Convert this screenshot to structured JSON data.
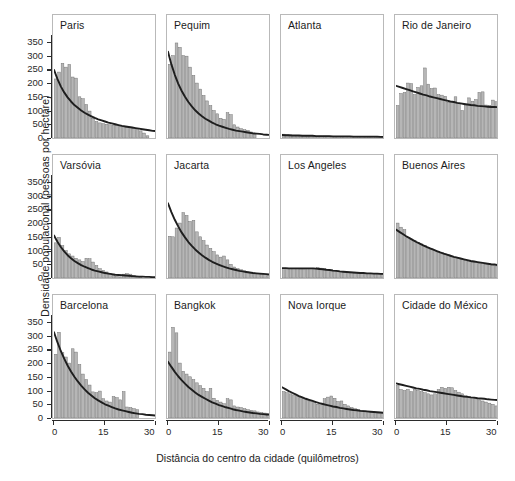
{
  "chart_data": {
    "type": "bar",
    "title": "",
    "xlabel": "Distância do centro da cidade (quilômetros)",
    "ylabel": "Densidade populacional (pessoas por hectare)",
    "xlim": [
      0,
      30
    ],
    "ylim": [
      0,
      375
    ],
    "yticks": [
      0,
      50,
      100,
      150,
      200,
      250,
      300,
      350
    ],
    "xticks": [
      0,
      15,
      30
    ],
    "grid": false,
    "legend": false,
    "layout": {
      "rows": 3,
      "cols": 4
    },
    "bin_width_km": 1,
    "series_note": "Each panel: histogram bars of population density by distance ring, with fitted exponential/linear decay curve overlay",
    "panels": [
      {
        "name": "Paris",
        "row": 0,
        "col": 0,
        "bars": [
          215,
          240,
          272,
          258,
          268,
          222,
          218,
          150,
          143,
          122,
          98,
          72,
          60,
          55,
          52,
          50,
          48,
          47,
          46,
          44,
          42,
          40,
          38,
          34,
          30,
          26,
          18,
          8
        ],
        "fit": [
          248,
          215,
          188,
          166,
          148,
          133,
          120,
          110,
          100,
          92,
          85,
          79,
          73,
          68,
          64,
          60,
          56,
          53,
          50,
          47,
          44,
          42,
          40,
          38,
          36,
          34,
          32,
          30,
          28,
          26,
          25
        ]
      },
      {
        "name": "Pequim",
        "row": 0,
        "col": 1,
        "bars": [
          268,
          300,
          346,
          330,
          300,
          298,
          258,
          228,
          200,
          178,
          155,
          135,
          118,
          100,
          88,
          72,
          68,
          92,
          85,
          48,
          40,
          34,
          30,
          28,
          22,
          14
        ],
        "fit": [
          314,
          268,
          230,
          198,
          172,
          150,
          131,
          115,
          101,
          89,
          79,
          70,
          63,
          56,
          50,
          45,
          41,
          37,
          33,
          30,
          27,
          25,
          23,
          21,
          19,
          17,
          16,
          15,
          13,
          12,
          11
        ]
      },
      {
        "name": "Atlanta",
        "row": 0,
        "col": 2,
        "bars": [
          14,
          12,
          11,
          10,
          10,
          9,
          9,
          8,
          8,
          8,
          7,
          7,
          7,
          7,
          6,
          6,
          6,
          6,
          6,
          5,
          5,
          5,
          5,
          5,
          4,
          4,
          4,
          4,
          4,
          4
        ],
        "fit": [
          11,
          10,
          10,
          9,
          9,
          9,
          8,
          8,
          8,
          8,
          7,
          7,
          7,
          7,
          7,
          6,
          6,
          6,
          6,
          6,
          6,
          5,
          5,
          5,
          5,
          5,
          5,
          5,
          5,
          4,
          4
        ]
      },
      {
        "name": "Rio de Janeiro",
        "row": 0,
        "col": 3,
        "bars": [
          118,
          162,
          166,
          200,
          198,
          158,
          184,
          190,
          255,
          196,
          180,
          182,
          158,
          156,
          152,
          130,
          132,
          150,
          126,
          100,
          118,
          146,
          134,
          140,
          166,
          168,
          120,
          118,
          138,
          132
        ],
        "fit": [
          190,
          186,
          182,
          178,
          174,
          170,
          166,
          162,
          158,
          155,
          151,
          148,
          145,
          142,
          139,
          136,
          133,
          131,
          128,
          126,
          124,
          122,
          120,
          119,
          117,
          116,
          115,
          114,
          113,
          113,
          112
        ]
      },
      {
        "name": "Varsóvia",
        "row": 1,
        "col": 0,
        "bars": [
          128,
          148,
          118,
          100,
          88,
          80,
          72,
          66,
          60,
          72,
          70,
          58,
          46,
          34,
          28,
          22,
          16,
          10,
          6,
          4,
          14,
          16,
          14,
          10,
          6,
          4
        ],
        "fit": [
          155,
          132,
          113,
          97,
          83,
          72,
          62,
          54,
          47,
          41,
          36,
          31,
          27,
          24,
          21,
          18,
          16,
          14,
          12,
          11,
          10,
          9,
          8,
          7,
          6,
          5,
          5,
          4,
          4,
          3,
          3
        ]
      },
      {
        "name": "Jacarta",
        "row": 1,
        "col": 1,
        "bars": [
          152,
          150,
          182,
          200,
          238,
          228,
          206,
          210,
          168,
          150,
          136,
          120,
          108,
          96,
          84,
          76,
          80,
          66,
          50,
          40,
          34,
          30,
          26,
          22,
          20,
          18,
          16,
          14,
          12,
          10
        ],
        "fit": [
          272,
          240,
          212,
          188,
          166,
          148,
          131,
          117,
          104,
          93,
          83,
          74,
          66,
          59,
          53,
          48,
          43,
          39,
          35,
          32,
          29,
          26,
          24,
          22,
          20,
          18,
          17,
          16,
          15,
          14,
          13
        ]
      },
      {
        "name": "Los Angeles",
        "row": 1,
        "col": 2,
        "bars": [
          34,
          36,
          35,
          34,
          34,
          33,
          33,
          34,
          35,
          36,
          38,
          36,
          34,
          32,
          30,
          28,
          26,
          24,
          22,
          20,
          19,
          18,
          18,
          17,
          17,
          16,
          16,
          15,
          15,
          14
        ],
        "fit": [
          36,
          36,
          35,
          35,
          35,
          35,
          35,
          35,
          35,
          35,
          34,
          33,
          32,
          30,
          29,
          27,
          26,
          24,
          23,
          22,
          21,
          20,
          19,
          18,
          18,
          17,
          17,
          16,
          16,
          15,
          15
        ]
      },
      {
        "name": "Buenos Aires",
        "row": 1,
        "col": 3,
        "bars": [
          200,
          185,
          176,
          148,
          142,
          136,
          130,
          124,
          118,
          112,
          106,
          100,
          96,
          92,
          88,
          84,
          80,
          76,
          72,
          68,
          64,
          60,
          58,
          56,
          54,
          52,
          50,
          48,
          46,
          44
        ],
        "fit": [
          176,
          168,
          160,
          152,
          145,
          138,
          131,
          125,
          119,
          113,
          108,
          103,
          98,
          93,
          89,
          85,
          81,
          77,
          74,
          71,
          68,
          65,
          62,
          60,
          58,
          56,
          54,
          52,
          50,
          49,
          47
        ]
      },
      {
        "name": "Barcelona",
        "row": 2,
        "col": 0,
        "bars": [
          232,
          312,
          238,
          222,
          200,
          252,
          240,
          195,
          160,
          140,
          120,
          95,
          92,
          98,
          70,
          62,
          58,
          78,
          74,
          66,
          96,
          40,
          38,
          34,
          30
        ],
        "fit": [
          312,
          276,
          244,
          216,
          191,
          169,
          150,
          133,
          118,
          104,
          92,
          82,
          72,
          64,
          57,
          50,
          45,
          40,
          35,
          31,
          28,
          25,
          22,
          19,
          17,
          15,
          14,
          12,
          11,
          10,
          9
        ]
      },
      {
        "name": "Bangkok",
        "row": 2,
        "col": 1,
        "bars": [
          240,
          330,
          310,
          200,
          170,
          160,
          150,
          140,
          128,
          118,
          108,
          96,
          108,
          72,
          64,
          58,
          52,
          70,
          66,
          44,
          40,
          38,
          34,
          30,
          28,
          26,
          22,
          20,
          18,
          16
        ],
        "fit": [
          205,
          186,
          168,
          152,
          138,
          125,
          113,
          103,
          93,
          84,
          77,
          70,
          63,
          57,
          52,
          47,
          43,
          39,
          36,
          32,
          29,
          27,
          24,
          22,
          20,
          18,
          17,
          15,
          14,
          13,
          12
        ]
      },
      {
        "name": "Nova Iorque",
        "row": 2,
        "col": 2,
        "bars": [
          96,
          92,
          88,
          84,
          78,
          74,
          70,
          66,
          60,
          56,
          50,
          48,
          70,
          76,
          80,
          72,
          60,
          62,
          50,
          44,
          38,
          34,
          30,
          28,
          26,
          24,
          22,
          20,
          18,
          16
        ],
        "fit": [
          112,
          105,
          98,
          92,
          86,
          80,
          75,
          70,
          66,
          62,
          58,
          54,
          51,
          48,
          45,
          42,
          40,
          37,
          35,
          33,
          31,
          29,
          28,
          26,
          25,
          24,
          23,
          22,
          21,
          20,
          19
        ]
      },
      {
        "name": "Cidade do México",
        "row": 2,
        "col": 3,
        "bars": [
          118,
          104,
          100,
          104,
          96,
          104,
          100,
          96,
          92,
          88,
          84,
          88,
          104,
          112,
          108,
          112,
          110,
          100,
          94,
          88,
          82,
          78,
          74,
          70,
          66,
          62,
          58,
          54,
          50,
          44
        ],
        "fit": [
          126,
          123,
          120,
          117,
          114,
          111,
          108,
          106,
          103,
          101,
          98,
          96,
          94,
          92,
          90,
          88,
          86,
          84,
          82,
          80,
          78,
          77,
          75,
          74,
          72,
          71,
          70,
          68,
          67,
          66,
          65
        ]
      }
    ]
  },
  "colors": {
    "bar_fill": "#b6b6b6",
    "bar_stroke": "#6f6f6f",
    "fit_line": "#1e1e1e",
    "panel_border": "#b9b9b9",
    "axis": "#2b2b2b",
    "text": "#1b1b1b",
    "background": "#ffffff"
  }
}
